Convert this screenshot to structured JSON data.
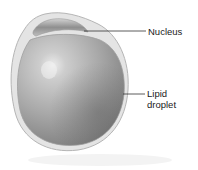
{
  "figure": {
    "labels": [
      {
        "id": "nucleus",
        "text": "Nucleus"
      },
      {
        "id": "lipid_droplet",
        "text": "Lipid\ndroplet"
      }
    ]
  },
  "colors": {
    "cell_membrane": "#c9c9c9",
    "cytoplasm_rim": "#e3e3e3",
    "nucleus_dark": "#8e8e8e",
    "nucleus_light": "#d0d0d0",
    "droplet_light": "#e6e6e6",
    "droplet_mid": "#a9a9a9",
    "droplet_dark": "#6f6f6f",
    "leader_line": "#333333",
    "label_text": "#1a1a1a"
  }
}
